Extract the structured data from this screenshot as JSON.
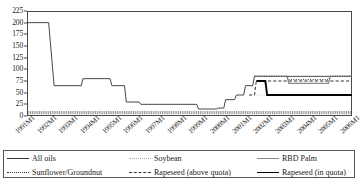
{
  "chart_data": {
    "type": "line",
    "title": "",
    "xlabel": "",
    "ylabel": "",
    "ylim": [
      0,
      225
    ],
    "ytick_step": 25,
    "grid": false,
    "legend_position": "bottom",
    "yticks": [
      "225",
      "200",
      "175",
      "150",
      "125",
      "100",
      "75",
      "50",
      "25",
      "0"
    ],
    "xticks": [
      "1991M1",
      "1992M1",
      "1993M1",
      "1994M1",
      "1995M1",
      "1996M1",
      "1997M1",
      "1998M1",
      "1999M1",
      "2000M1",
      "2001M1",
      "2002M1",
      "2003M1",
      "2004M1",
      "2005M1",
      "2006M1"
    ],
    "xlim": [
      "1991M1",
      "2006M1"
    ],
    "series": [
      {
        "name": "All oils",
        "style": "solid",
        "color": "#333333",
        "points": [
          {
            "x": "1991M1",
            "y": 200
          },
          {
            "x": "1992M1",
            "y": 200
          },
          {
            "x": "1992M4",
            "y": 65
          },
          {
            "x": "1993M7",
            "y": 65
          },
          {
            "x": "1993M8",
            "y": 80
          },
          {
            "x": "1994M11",
            "y": 80
          },
          {
            "x": "1994M12",
            "y": 65
          },
          {
            "x": "1995M7",
            "y": 65
          },
          {
            "x": "1995M8",
            "y": 30
          },
          {
            "x": "1996M3",
            "y": 30
          },
          {
            "x": "1996M4",
            "y": 25
          },
          {
            "x": "1998M11",
            "y": 25
          },
          {
            "x": "1998M12",
            "y": 15
          },
          {
            "x": "1999M10",
            "y": 15
          },
          {
            "x": "1999M11",
            "y": 17
          },
          {
            "x": "2000M2",
            "y": 17
          },
          {
            "x": "2000M3",
            "y": 35
          },
          {
            "x": "2000M8",
            "y": 35
          },
          {
            "x": "2000M9",
            "y": 45
          },
          {
            "x": "2001M1",
            "y": 45
          },
          {
            "x": "2001M2",
            "y": 65
          },
          {
            "x": "2001M6",
            "y": 65
          },
          {
            "x": "2001M7",
            "y": 85
          },
          {
            "x": "2006M1",
            "y": 85
          }
        ]
      },
      {
        "name": "Soybean",
        "style": "fine-dotted",
        "color": "#aaaaaa",
        "points": [
          {
            "x": "2001M7",
            "y": 45
          },
          {
            "x": "2002M3",
            "y": 45
          },
          {
            "x": "2002M4",
            "y": 45
          },
          {
            "x": "2006M1",
            "y": 45
          }
        ]
      },
      {
        "name": "RBD Palm",
        "style": "gray-solid",
        "color": "#888888",
        "points": [
          {
            "x": "2001M7",
            "y": 85
          },
          {
            "x": "2003M1",
            "y": 85
          },
          {
            "x": "2003M2",
            "y": 70
          },
          {
            "x": "2004M12",
            "y": 70
          },
          {
            "x": "2005M1",
            "y": 85
          },
          {
            "x": "2006M1",
            "y": 85
          }
        ]
      },
      {
        "name": "Sunflower/Groundnut",
        "style": "dotted",
        "color": "#333333",
        "points": [
          {
            "x": "2001M7",
            "y": 85
          },
          {
            "x": "2003M1",
            "y": 85
          },
          {
            "x": "2003M2",
            "y": 78
          },
          {
            "x": "2004M12",
            "y": 78
          },
          {
            "x": "2005M1",
            "y": 85
          },
          {
            "x": "2006M1",
            "y": 85
          }
        ]
      },
      {
        "name": "Rapeseed (above quota)",
        "style": "dashed",
        "color": "#333333",
        "points": [
          {
            "x": "2001M4",
            "y": 45
          },
          {
            "x": "2001M7",
            "y": 45
          },
          {
            "x": "2001M8",
            "y": 75
          },
          {
            "x": "2006M1",
            "y": 75
          }
        ]
      },
      {
        "name": "Rapeseed (in quota)",
        "style": "thick-solid",
        "color": "#000000",
        "points": [
          {
            "x": "2001M8",
            "y": 75
          },
          {
            "x": "2002M1",
            "y": 75
          },
          {
            "x": "2002M2",
            "y": 45
          },
          {
            "x": "2006M1",
            "y": 45
          }
        ]
      }
    ]
  },
  "legend": {
    "items": [
      {
        "label": "All oils",
        "swatch": "sw-solid"
      },
      {
        "label": "Soybean",
        "swatch": "sw-finedot"
      },
      {
        "label": "RBD Palm",
        "swatch": "sw-gray"
      },
      {
        "label": "Sunflower/Groundnut",
        "swatch": "sw-dotted"
      },
      {
        "label": "Rapeseed (above quota)",
        "swatch": "sw-dashed"
      },
      {
        "label": "Rapeseed (in quota)",
        "swatch": "sw-thick"
      }
    ]
  }
}
